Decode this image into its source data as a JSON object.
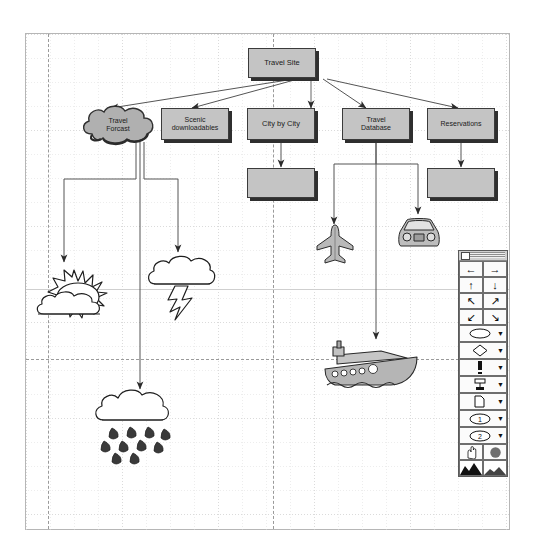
{
  "app": {
    "kind": "flowchart-diagram-editor",
    "canvas_background": "#ffffff",
    "node_fill": "#c4c4c4",
    "node_stroke": "#3b3b3b",
    "shadow_color": "#2f2f2f",
    "grid_color": "#d8d8d8",
    "pagebreak_color": "#9a9a9a"
  },
  "diagram": {
    "title_node": {
      "label": "Travel Site"
    },
    "nodes": [
      {
        "id": "travel-site",
        "label": "Travel Site",
        "shape": "box"
      },
      {
        "id": "travel-forcast",
        "label": "Travel\nForcast",
        "label_line1": "Travel",
        "label_line2": "Forcast",
        "shape": "cloud"
      },
      {
        "id": "scenic-downloads",
        "label": "Scenic downloadables",
        "label_line1": "Scenic",
        "label_line2": "downloadables",
        "shape": "box"
      },
      {
        "id": "city-by-city",
        "label": "City by City",
        "shape": "box"
      },
      {
        "id": "travel-database",
        "label": "Travel Database",
        "label_line1": "Travel",
        "label_line2": "Database",
        "shape": "box"
      },
      {
        "id": "reservations",
        "label": "Reservations",
        "shape": "box"
      },
      {
        "id": "city-child",
        "label": "",
        "shape": "box"
      },
      {
        "id": "reservations-child",
        "label": "",
        "shape": "box"
      }
    ],
    "clipart": [
      {
        "id": "sun-cloud",
        "name": "sun-behind-cloud-clipart"
      },
      {
        "id": "storm",
        "name": "cloud-lightning-clipart"
      },
      {
        "id": "rain",
        "name": "rain-cloud-clipart"
      },
      {
        "id": "airplane",
        "name": "airplane-clipart"
      },
      {
        "id": "car",
        "name": "car-clipart"
      },
      {
        "id": "ship",
        "name": "ship-clipart"
      }
    ],
    "connectors": [
      {
        "from": "travel-site",
        "to": "travel-forcast"
      },
      {
        "from": "travel-site",
        "to": "scenic-downloads"
      },
      {
        "from": "travel-site",
        "to": "city-by-city"
      },
      {
        "from": "travel-site",
        "to": "travel-database"
      },
      {
        "from": "travel-site",
        "to": "reservations"
      },
      {
        "from": "travel-forcast",
        "to": "sun-cloud"
      },
      {
        "from": "travel-forcast",
        "to": "rain"
      },
      {
        "from": "travel-forcast",
        "to": "storm"
      },
      {
        "from": "city-by-city",
        "to": "city-child"
      },
      {
        "from": "reservations",
        "to": "reservations-child"
      },
      {
        "from": "travel-database",
        "to": "airplane"
      },
      {
        "from": "travel-database",
        "to": "car"
      },
      {
        "from": "travel-database",
        "to": "ship"
      }
    ]
  },
  "palette": {
    "name": "shapes-and-arrows-toolbar",
    "title": "",
    "rows": [
      {
        "type": "pair",
        "left": {
          "name": "arrow-left-button",
          "glyph": "←"
        },
        "right": {
          "name": "arrow-right-button",
          "glyph": "→"
        }
      },
      {
        "type": "pair",
        "left": {
          "name": "arrow-up-button",
          "glyph": "↑"
        },
        "right": {
          "name": "arrow-down-button",
          "glyph": "↓"
        }
      },
      {
        "type": "pair",
        "left": {
          "name": "arrow-up-left-button",
          "glyph": "↖"
        },
        "right": {
          "name": "arrow-up-right-button",
          "glyph": "↗"
        }
      },
      {
        "type": "pair",
        "left": {
          "name": "arrow-down-left-button",
          "glyph": "↙"
        },
        "right": {
          "name": "arrow-down-right-button",
          "glyph": "↘"
        }
      },
      {
        "type": "wide",
        "item": {
          "name": "ellipse-shape-dropdown",
          "glyph": "ellipse",
          "caret": "▼"
        }
      },
      {
        "type": "wide",
        "item": {
          "name": "diamond-shape-dropdown",
          "glyph": "diamond",
          "caret": "▼"
        }
      },
      {
        "type": "wide",
        "item": {
          "name": "line-shape-dropdown",
          "glyph": "line",
          "caret": "▼"
        }
      },
      {
        "type": "wide",
        "item": {
          "name": "connector-shape-dropdown",
          "glyph": "connector",
          "caret": "▼"
        }
      },
      {
        "type": "wide",
        "item": {
          "name": "page-shape-dropdown",
          "glyph": "page",
          "caret": "▼"
        }
      },
      {
        "type": "wide",
        "item": {
          "name": "numbered-one-dropdown",
          "glyph": "circle-1",
          "label": "1",
          "caret": "▼"
        }
      },
      {
        "type": "wide",
        "item": {
          "name": "numbered-two-dropdown",
          "glyph": "circle-2",
          "label": "2",
          "caret": "▼"
        }
      },
      {
        "type": "pair",
        "left": {
          "name": "hand-pan-tool-button",
          "glyph": "hand"
        },
        "right": {
          "name": "fill-color-button",
          "glyph": "filled-circle"
        }
      },
      {
        "type": "pair",
        "left": {
          "name": "gradient-fill-button",
          "glyph": "mountain-dark"
        },
        "right": {
          "name": "pattern-fill-button",
          "glyph": "mountain-light"
        }
      }
    ]
  }
}
